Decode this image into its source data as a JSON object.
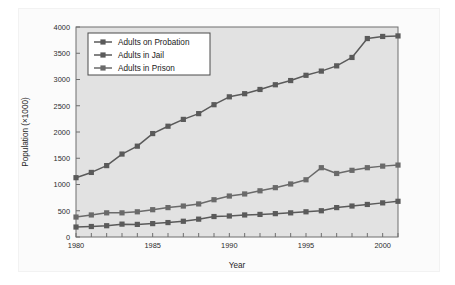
{
  "figure": {
    "plot_bg_color": "#e2e2e2",
    "frame_color": "#6e6e6e"
  },
  "legend": {
    "position": "top-left-inside",
    "entries": [
      {
        "label": "Adults on Probation",
        "color": "#5a5a5a"
      },
      {
        "label": "Adults in Jail",
        "color": "#5a5a5a"
      },
      {
        "label": "Adults in Prison",
        "color": "#6a6a6a"
      }
    ]
  },
  "chart_data": {
    "type": "line",
    "title": "",
    "subtitle": "",
    "xlabel": "Year",
    "ylabel": "Population (×1000)",
    "xlim": [
      1980,
      2001
    ],
    "ylim": [
      0,
      4000
    ],
    "grid": false,
    "x_tick_step": 1,
    "x_label_step": 5,
    "y_tick_step": 500,
    "x_tick_labels": [
      "1980",
      "1985",
      "1990",
      "1995",
      "2000"
    ],
    "y_tick_labels": [
      "0",
      "500",
      "1000",
      "1500",
      "2000",
      "2500",
      "3000",
      "3500",
      "4000"
    ],
    "x": [
      1980,
      1981,
      1982,
      1983,
      1984,
      1985,
      1986,
      1987,
      1988,
      1989,
      1990,
      1991,
      1992,
      1993,
      1994,
      1995,
      1996,
      1997,
      1998,
      1999,
      2000,
      2001
    ],
    "series": [
      {
        "name": "Adults on Probation",
        "color": "#5a5a5a",
        "marker": "square",
        "values": [
          1130,
          1230,
          1360,
          1580,
          1730,
          1970,
          2110,
          2240,
          2350,
          2520,
          2670,
          2730,
          2810,
          2900,
          2980,
          3080,
          3160,
          3260,
          3420,
          3780,
          3820,
          3830
        ]
      },
      {
        "name": "Adults in Jail",
        "color": "#5a5a5a",
        "marker": "square",
        "values": [
          190,
          200,
          215,
          245,
          240,
          255,
          275,
          300,
          340,
          390,
          400,
          420,
          430,
          445,
          460,
          480,
          500,
          560,
          590,
          620,
          650,
          680
        ]
      },
      {
        "name": "Adults in Prison",
        "color": "#6a6a6a",
        "marker": "square",
        "values": [
          380,
          420,
          460,
          460,
          480,
          520,
          560,
          590,
          630,
          710,
          780,
          820,
          880,
          940,
          1010,
          1090,
          1320,
          1210,
          1270,
          1320,
          1350,
          1370
        ]
      }
    ]
  }
}
